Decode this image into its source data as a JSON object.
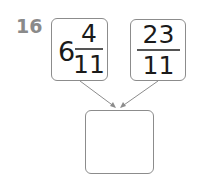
{
  "question": {
    "number": "16",
    "operand1": {
      "whole": "6",
      "numerator": "4",
      "denominator": "11"
    },
    "operand2": {
      "numerator": "23",
      "denominator": "11"
    },
    "answer": ""
  },
  "colors": {
    "label": "#8a8a8a",
    "border": "#8c8c8c",
    "text": "#1a1a1a"
  }
}
